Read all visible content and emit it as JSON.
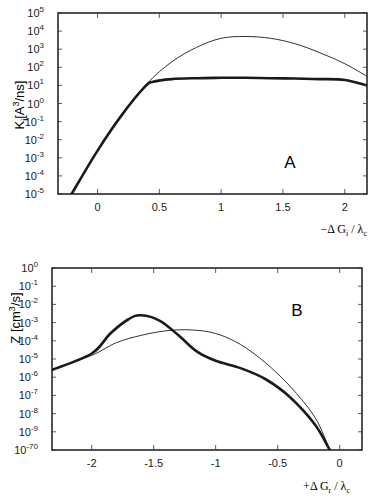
{
  "chart_data": [
    {
      "type": "line",
      "panel_label": "A",
      "title": "",
      "xlabel": "−ΔG_i / λ_c",
      "ylabel": "K_i [A³/ns]",
      "yscale": "log",
      "xlim": [
        -0.32,
        2.18
      ],
      "ylim": [
        1e-05,
        100000.0
      ],
      "x_ticks": [
        "0",
        "0.5",
        "1",
        "1.5",
        "2"
      ],
      "y_ticks": [
        "10^5",
        "10^4",
        "10^3",
        "10^2",
        "10^1",
        "10^0",
        "10^-1",
        "10^-2",
        "10^-3",
        "10^-4",
        "10^-5"
      ],
      "grid": false,
      "series": [
        {
          "name": "thin",
          "style": "thin",
          "x": [
            -0.21,
            0.0,
            0.2,
            0.4,
            0.6,
            0.8,
            1.0,
            1.2,
            1.4,
            1.6,
            1.8,
            2.0,
            2.18
          ],
          "log10_y": [
            -5,
            -2.6,
            -0.6,
            1.1,
            2.3,
            3.1,
            3.6,
            3.7,
            3.6,
            3.3,
            2.8,
            2.2,
            1.5
          ]
        },
        {
          "name": "thick",
          "style": "thick",
          "x": [
            -0.21,
            0.0,
            0.2,
            0.38,
            0.45,
            0.6,
            0.8,
            1.0,
            1.2,
            1.4,
            1.6,
            1.8,
            2.0,
            2.18
          ],
          "log10_y": [
            -5,
            -2.6,
            -0.6,
            0.9,
            1.2,
            1.35,
            1.4,
            1.42,
            1.42,
            1.4,
            1.38,
            1.35,
            1.3,
            1.0
          ]
        }
      ]
    },
    {
      "type": "line",
      "panel_label": "B",
      "title": "",
      "xlabel": "+ΔG_r / λ_c",
      "ylabel": "Z [cm³/s]",
      "yscale": "log",
      "xlim": [
        -2.32,
        0.18
      ],
      "ylim": [
        1e-10,
        1.0
      ],
      "x_ticks": [
        "-2",
        "-1.5",
        "-1",
        "-0.5",
        "0"
      ],
      "y_ticks": [
        "10^0",
        "10^-1",
        "10^-2",
        "10^-3",
        "10^-4",
        "10^-5",
        "10^-6",
        "10^-7",
        "10^-8",
        "10^-9",
        "10^-70"
      ],
      "grid": false,
      "series": [
        {
          "name": "thin",
          "style": "thin",
          "x": [
            -2.32,
            -2.0,
            -1.8,
            -1.6,
            -1.4,
            -1.2,
            -1.0,
            -0.8,
            -0.6,
            -0.4,
            -0.2,
            -0.08
          ],
          "log10_y": [
            -5.6,
            -4.8,
            -4.1,
            -3.7,
            -3.45,
            -3.4,
            -3.6,
            -4.2,
            -5.2,
            -6.5,
            -8.2,
            -10
          ]
        },
        {
          "name": "thick",
          "style": "thick",
          "x": [
            -2.32,
            -2.0,
            -1.85,
            -1.7,
            -1.6,
            -1.45,
            -1.3,
            -1.15,
            -1.0,
            -0.8,
            -0.6,
            -0.4,
            -0.2,
            -0.08
          ],
          "log10_y": [
            -5.6,
            -4.7,
            -3.6,
            -2.8,
            -2.6,
            -2.9,
            -3.7,
            -4.6,
            -5.1,
            -5.5,
            -6.1,
            -7.1,
            -8.6,
            -10
          ]
        }
      ]
    }
  ],
  "panels": {
    "a": {
      "label": "A",
      "ylabel": "K",
      "ylabel_sub": "i",
      "ylabel_rest": "[A",
      "ylabel_sup": "3",
      "ylabel_end": "/ns]",
      "xlabel_prefix": "−Δ G",
      "xlabel_sub1": "i",
      "xlabel_mid": " / λ",
      "xlabel_sub2": "c",
      "x_ticks": [
        "0",
        "0.5",
        "1",
        "1.5",
        "2"
      ],
      "y_exps": [
        "5",
        "4",
        "3",
        "2",
        "1",
        "0",
        "-1",
        "-2",
        "-3",
        "-4",
        "-5"
      ]
    },
    "b": {
      "label": "B",
      "ylabel": "Z  [cm",
      "ylabel_sup": "3",
      "ylabel_end": "/s]",
      "xlabel_prefix": "+Δ G",
      "xlabel_sub1": "r",
      "xlabel_mid": " / λ",
      "xlabel_sub2": "c",
      "x_ticks": [
        "-2",
        "-1.5",
        "-1",
        "-0.5",
        "0"
      ],
      "y_exps": [
        "0",
        "-1",
        "-2",
        "-3",
        "-4",
        "-5",
        "-6",
        "-7",
        "-8",
        "-9",
        "-70"
      ]
    }
  }
}
